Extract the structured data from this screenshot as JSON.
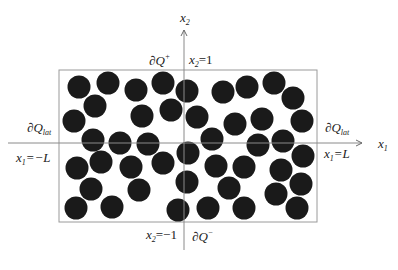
{
  "diagram": {
    "axes": {
      "x_axis_label": "x",
      "x_axis_sub": "1",
      "y_axis_label": "x",
      "y_axis_sub": "2"
    },
    "labels": {
      "top_boundary": "∂Q",
      "top_boundary_sup": "+",
      "bottom_boundary": "∂Q",
      "bottom_boundary_sup": "−",
      "left_lateral": "∂Q",
      "left_lateral_sub": "lat",
      "right_lateral": "∂Q",
      "right_lateral_sub": "lat",
      "top_line": "=1",
      "bottom_line": "=−1",
      "left_line": "=−L",
      "right_line": "=L",
      "x1": "x",
      "x2": "x",
      "sub1": "1",
      "sub2": "2"
    },
    "colors": {
      "particle": "#1a1a1a",
      "box": "#9a9a9a",
      "axis": "#8a8a8a"
    },
    "box": {
      "left": 59,
      "top": 70,
      "right": 317,
      "bottom": 222
    },
    "particle_radius": 11.5,
    "particles": [
      [
        79,
        87
      ],
      [
        108,
        83
      ],
      [
        136,
        90
      ],
      [
        163,
        83
      ],
      [
        187,
        91
      ],
      [
        223,
        92
      ],
      [
        247,
        87
      ],
      [
        274,
        83
      ],
      [
        293,
        98
      ],
      [
        95,
        106
      ],
      [
        142,
        116
      ],
      [
        171,
        110
      ],
      [
        197,
        117
      ],
      [
        74,
        121
      ],
      [
        235,
        124
      ],
      [
        262,
        119
      ],
      [
        302,
        121
      ],
      [
        93,
        140
      ],
      [
        120,
        143
      ],
      [
        148,
        144
      ],
      [
        212,
        139
      ],
      [
        258,
        145
      ],
      [
        283,
        141
      ],
      [
        188,
        153
      ],
      [
        303,
        156
      ],
      [
        77,
        168
      ],
      [
        101,
        162
      ],
      [
        131,
        167
      ],
      [
        163,
        163
      ],
      [
        216,
        166
      ],
      [
        244,
        167
      ],
      [
        281,
        170
      ],
      [
        91,
        189
      ],
      [
        139,
        190
      ],
      [
        187,
        182
      ],
      [
        229,
        188
      ],
      [
        276,
        194
      ],
      [
        301,
        184
      ],
      [
        76,
        208
      ],
      [
        112,
        207
      ],
      [
        178,
        210
      ],
      [
        208,
        208
      ],
      [
        244,
        208
      ],
      [
        297,
        208
      ]
    ]
  }
}
